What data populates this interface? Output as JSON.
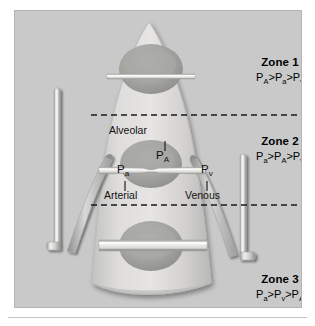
{
  "figure": {
    "panel_bg": "#c9c9c9",
    "lung_fill": "#d8d8d6",
    "vessel_color": "#c4c4c2",
    "alveolus_color": "#9d9d9b",
    "text_color": "#111111"
  },
  "zones": [
    {
      "id": "zone-1",
      "title": "Zone 1",
      "equation": "P_A>P_a>P_v",
      "eq_parts": [
        {
          "base": "P",
          "sub": "A"
        },
        {
          "op": ">"
        },
        {
          "base": "P",
          "sub": "a"
        },
        {
          "op": ">"
        },
        {
          "base": "P",
          "sub": "v"
        }
      ]
    },
    {
      "id": "zone-2",
      "title": "Zone 2",
      "equation": "P_a>P_A>P_v",
      "eq_parts": [
        {
          "base": "P",
          "sub": "a"
        },
        {
          "op": ">"
        },
        {
          "base": "P",
          "sub": "A"
        },
        {
          "op": ">"
        },
        {
          "base": "P",
          "sub": "v"
        }
      ]
    },
    {
      "id": "zone-3",
      "title": "Zone 3",
      "equation": "P_a>P_v>P_A",
      "eq_parts": [
        {
          "base": "P",
          "sub": "a"
        },
        {
          "op": ">"
        },
        {
          "base": "P",
          "sub": "v"
        },
        {
          "op": ">"
        },
        {
          "base": "P",
          "sub": "A"
        }
      ]
    }
  ],
  "annotations": {
    "alveolar_label": "Alveolar",
    "alveolar_symbol_base": "P",
    "alveolar_symbol_sub": "A",
    "arterial_label": "Arterial",
    "arterial_symbol_base": "P",
    "arterial_symbol_sub": "a",
    "venous_label": "Venous",
    "venous_symbol_base": "P",
    "venous_symbol_sub": "v"
  }
}
